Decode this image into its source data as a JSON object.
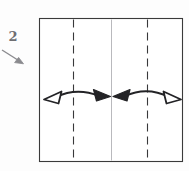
{
  "figure": {
    "kind": "origami-fold-diagram",
    "background_color": "#fdfdfd"
  },
  "step": {
    "number": "2",
    "number_color": "#6e6e72",
    "flow_arrow_name": "step-flow-arrow-southeast",
    "flow_arrow_color": "#8a8a8e"
  },
  "paper": {
    "label": "square-sheet",
    "border_color": "#3a3a3a",
    "fill_color": "#ffffff",
    "x": 39,
    "y": 18,
    "width": 144,
    "height": 144
  },
  "crease_lines": [
    {
      "name": "quarter-crease-left",
      "style": "dashed",
      "color": "#38383a",
      "x": 73.5,
      "y1": 19,
      "y2": 161
    },
    {
      "name": "center-crease",
      "style": "solid",
      "color": "#b9b9bd",
      "x": 111.5,
      "y1": 19,
      "y2": 161
    },
    {
      "name": "quarter-crease-right",
      "style": "dashed",
      "color": "#38383a",
      "x": 147.5,
      "y1": 19,
      "y2": 161
    }
  ],
  "fold_arrows": [
    {
      "name": "fold-arrow-left-pair",
      "color": "#232326",
      "from_head": "hollow",
      "to_head": "solid",
      "x_start": 44,
      "x_end": 110,
      "y": 96,
      "curve_rise": 9
    },
    {
      "name": "fold-arrow-right-pair",
      "color": "#232326",
      "from_head": "solid",
      "to_head": "hollow",
      "x_start": 113,
      "x_end": 180,
      "y": 96,
      "curve_rise": 9
    }
  ],
  "annotations": {
    "step_number_x": 13,
    "step_number_y": 41
  }
}
